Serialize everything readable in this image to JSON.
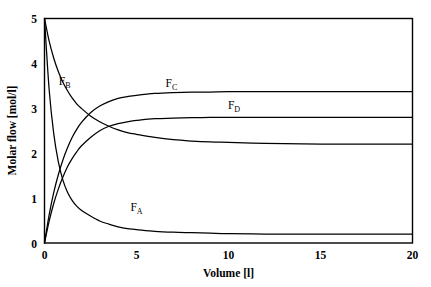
{
  "chart_data": {
    "type": "line",
    "title": "",
    "xlabel": "Volume [l]",
    "ylabel": "Molar flow [mol/l]",
    "xlim": [
      0,
      20
    ],
    "ylim": [
      0,
      5
    ],
    "xticks": [
      "0",
      "5",
      "10",
      "15",
      "20"
    ],
    "xtick_values": [
      0,
      5,
      10,
      15,
      20
    ],
    "yticks": [
      "0",
      "1",
      "2",
      "3",
      "4",
      "5"
    ],
    "ytick_values": [
      0,
      1,
      2,
      3,
      4,
      5
    ],
    "grid": false,
    "legend": "inline-annotations",
    "x": [
      0,
      0.25,
      0.5,
      0.75,
      1,
      1.25,
      1.5,
      1.75,
      2,
      2.5,
      3,
      3.5,
      4,
      4.5,
      5,
      6,
      7,
      8,
      9,
      10,
      12,
      14,
      16,
      18,
      20
    ],
    "series": [
      {
        "name": "F_A",
        "label_text": "F",
        "label_sub": "A",
        "label_x": 5.0,
        "label_y": 0.72,
        "start_value": 5.0,
        "asymptote": 0.2,
        "values": [
          5.0,
          3.43,
          2.44,
          1.81,
          1.4,
          1.13,
          0.95,
          0.82,
          0.73,
          0.6,
          0.49,
          0.42,
          0.36,
          0.32,
          0.3,
          0.26,
          0.24,
          0.23,
          0.22,
          0.21,
          0.2,
          0.2,
          0.2,
          0.2,
          0.2
        ]
      },
      {
        "name": "F_B",
        "label_text": "F",
        "label_sub": "B",
        "label_x": 1.1,
        "label_y": 3.52,
        "start_value": 5.0,
        "asymptote": 2.2,
        "values": [
          5.0,
          4.5,
          4.12,
          3.82,
          3.58,
          3.39,
          3.23,
          3.1,
          3.0,
          2.83,
          2.7,
          2.6,
          2.52,
          2.46,
          2.42,
          2.35,
          2.3,
          2.27,
          2.25,
          2.24,
          2.22,
          2.21,
          2.2,
          2.2,
          2.2
        ]
      },
      {
        "name": "F_C",
        "label_text": "F",
        "label_sub": "C",
        "label_x": 6.9,
        "label_y": 3.47,
        "start_value": 0.0,
        "asymptote": 3.37,
        "values": [
          0.0,
          0.62,
          1.12,
          1.52,
          1.85,
          2.12,
          2.35,
          2.53,
          2.68,
          2.9,
          3.05,
          3.15,
          3.22,
          3.26,
          3.29,
          3.33,
          3.35,
          3.36,
          3.36,
          3.37,
          3.37,
          3.37,
          3.37,
          3.37,
          3.37
        ]
      },
      {
        "name": "F_D",
        "label_text": "F",
        "label_sub": "D",
        "label_x": 10.3,
        "label_y": 2.98,
        "start_value": 0.0,
        "asymptote": 2.8,
        "values": [
          0.0,
          0.48,
          0.88,
          1.2,
          1.47,
          1.7,
          1.88,
          2.03,
          2.16,
          2.35,
          2.5,
          2.6,
          2.66,
          2.7,
          2.73,
          2.77,
          2.78,
          2.79,
          2.8,
          2.8,
          2.8,
          2.8,
          2.8,
          2.8,
          2.8
        ]
      }
    ]
  },
  "axes": {
    "x_title": "Volume [l]",
    "y_title": "Molar flow [mol/l]",
    "x_tick_labels": [
      "0",
      "5",
      "10",
      "15",
      "20"
    ],
    "y_tick_labels": [
      "5",
      "4",
      "3",
      "2",
      "1",
      "0"
    ]
  }
}
